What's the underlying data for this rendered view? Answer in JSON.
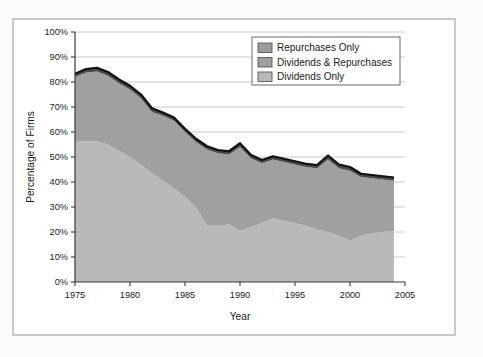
{
  "chart_data": {
    "type": "area",
    "title": "",
    "subtitle": "",
    "xlabel": "Year",
    "ylabel": "Percentage of Firms",
    "xlim": [
      1975,
      2005
    ],
    "ylim": [
      0,
      100
    ],
    "grid": true,
    "stacked": true,
    "legend_position": "top-right",
    "ytick_labels": [
      "0%",
      "10%",
      "20%",
      "30%",
      "40%",
      "50%",
      "60%",
      "70%",
      "80%",
      "90%",
      "100%"
    ],
    "ytick_values": [
      0,
      10,
      20,
      30,
      40,
      50,
      60,
      70,
      80,
      90,
      100
    ],
    "xtick_labels": [
      "1975",
      "1980",
      "1985",
      "1990",
      "1995",
      "2000",
      "2005"
    ],
    "xtick_values": [
      1975,
      1980,
      1985,
      1990,
      1995,
      2000,
      2005
    ],
    "x": [
      1975,
      1976,
      1977,
      1978,
      1979,
      1980,
      1981,
      1982,
      1983,
      1984,
      1985,
      1986,
      1987,
      1988,
      1989,
      1990,
      1991,
      1992,
      1993,
      1994,
      1995,
      1996,
      1997,
      1998,
      1999,
      2000,
      2001,
      2002,
      2003,
      2004
    ],
    "series": [
      {
        "name": "Dividends Only",
        "color": "#b9b9b9",
        "values": [
          56.0,
          56.3,
          56.2,
          55.0,
          52.5,
          50.0,
          47.0,
          43.5,
          40.5,
          37.5,
          34.0,
          30.0,
          22.5,
          22.5,
          23.0,
          20.5,
          22.0,
          23.5,
          25.5,
          24.5,
          23.5,
          22.5,
          21.0,
          20.0,
          18.5,
          16.5,
          18.5,
          19.5,
          20.0,
          20.5
        ]
      },
      {
        "name": "Dividends & Repurchases",
        "color": "#a0a0a0",
        "values": [
          26.0,
          27.5,
          28.0,
          27.5,
          27.0,
          27.0,
          26.5,
          24.5,
          26.0,
          27.0,
          26.0,
          26.0,
          30.5,
          29.0,
          28.0,
          33.5,
          27.5,
          24.0,
          23.5,
          23.5,
          23.5,
          23.5,
          24.5,
          29.0,
          27.0,
          28.0,
          23.5,
          22.0,
          21.0,
          20.0
        ]
      },
      {
        "name": "Repurchases Only",
        "color": "#4a4a4a",
        "values": [
          1.3,
          1.4,
          1.5,
          1.5,
          1.5,
          1.5,
          1.5,
          1.5,
          1.3,
          1.3,
          1.3,
          1.3,
          1.3,
          1.3,
          1.3,
          1.5,
          1.3,
          1.3,
          1.3,
          1.3,
          1.3,
          1.3,
          1.3,
          1.6,
          1.5,
          1.5,
          1.3,
          1.3,
          1.3,
          1.3
        ]
      }
    ],
    "totals": [
      83.3,
      85.2,
      85.7,
      84.0,
      81.0,
      78.5,
      75.0,
      69.5,
      67.8,
      65.8,
      61.3,
      57.3,
      54.3,
      52.8,
      52.3,
      55.5,
      50.8,
      48.8,
      50.3,
      49.3,
      48.3,
      47.3,
      46.8,
      50.6,
      47.0,
      46.0,
      43.3,
      42.8,
      42.3,
      41.8
    ]
  },
  "axes": {
    "ylabel": "Percentage of Firms",
    "xlabel": "Year"
  },
  "legend": {
    "items": [
      {
        "label": "Repurchases Only",
        "swatch": "#9a9a9a"
      },
      {
        "label": "Dividends & Repurchases",
        "swatch": "#a0a0a0"
      },
      {
        "label": "Dividends Only",
        "swatch": "#b9b9b9"
      }
    ]
  },
  "colors": {
    "dividends_only": "#b9b9b9",
    "dividends_and_repurchases": "#a0a0a0",
    "repurchases_only": "#4a4a4a",
    "frame": "#c9c9c9",
    "grid": "#c4c4c4",
    "axis": "#3a3a3a",
    "page_background": "#fbfbfb"
  }
}
